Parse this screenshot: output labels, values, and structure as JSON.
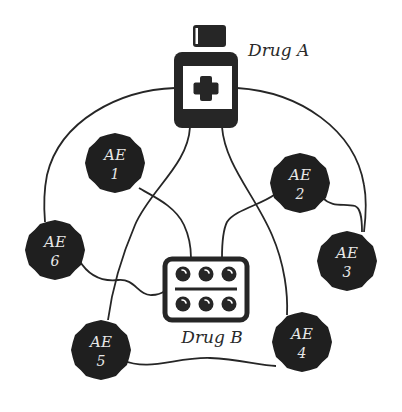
{
  "diagram": {
    "type": "drug-adverse-event network",
    "colors": {
      "background": "#ffffff",
      "ink": "#262626",
      "ae_fill": "#1f1f1f",
      "ae_text": "#e8e8e8"
    },
    "drugs": [
      {
        "id": "drugA",
        "label": "Drug A",
        "icon": "medicine-bottle-icon"
      },
      {
        "id": "drugB",
        "label": "Drug B",
        "icon": "pill-blister-pack-icon"
      }
    ],
    "adverse_events": [
      {
        "id": "ae1",
        "title": "AE",
        "number": "1"
      },
      {
        "id": "ae2",
        "title": "AE",
        "number": "2"
      },
      {
        "id": "ae3",
        "title": "AE",
        "number": "3"
      },
      {
        "id": "ae4",
        "title": "AE",
        "number": "4"
      },
      {
        "id": "ae5",
        "title": "AE",
        "number": "5"
      },
      {
        "id": "ae6",
        "title": "AE",
        "number": "6"
      }
    ],
    "edges": [
      [
        "drugA",
        "ae6"
      ],
      [
        "drugA",
        "ae3"
      ],
      [
        "drugA",
        "ae5"
      ],
      [
        "drugA",
        "ae4"
      ],
      [
        "drugB",
        "ae1"
      ],
      [
        "drugB",
        "ae2"
      ],
      [
        "drugB",
        "ae6"
      ],
      [
        "ae2",
        "ae3"
      ],
      [
        "ae5",
        "ae4"
      ]
    ]
  }
}
